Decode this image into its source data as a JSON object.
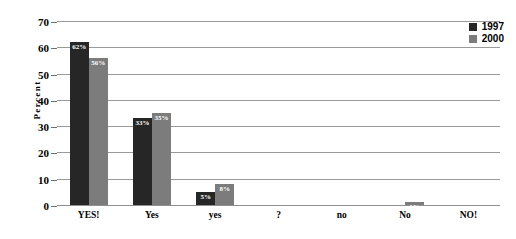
{
  "chart_data": {
    "type": "bar",
    "title": "",
    "subtitle": "",
    "xlabel": "",
    "ylabel": "Percent",
    "categories": [
      "YES!",
      "Yes",
      "yes",
      "?",
      "no",
      "No",
      "NO!"
    ],
    "series": [
      {
        "name": "1997",
        "color": "#262626",
        "values": [
          62,
          33,
          5,
          0,
          0,
          0,
          0
        ],
        "labels": [
          "62%",
          "33%",
          "5%",
          "",
          "",
          "",
          ""
        ]
      },
      {
        "name": "2000",
        "color": "#7c7c7c",
        "values": [
          56,
          35,
          8,
          0,
          0,
          1,
          0
        ],
        "labels": [
          "56%",
          "35%",
          "8%",
          "",
          "",
          "1%",
          ""
        ]
      }
    ],
    "ylim": [
      0,
      70
    ],
    "yticks": [
      0,
      10,
      20,
      30,
      40,
      50,
      60,
      70
    ],
    "ytick_labels": [
      "0",
      "10",
      "20",
      "30",
      "40",
      "50",
      "60",
      "70"
    ],
    "grid": true,
    "grid_axis": "y",
    "legend_position": "top-right",
    "value_labels_inside_bars": true
  },
  "legend": {
    "entries": [
      {
        "label": "1997",
        "swatch": "legend-swatch-1997"
      },
      {
        "label": "2000",
        "swatch": "legend-swatch-2000"
      }
    ]
  },
  "colors": {
    "series_1997": "#262626",
    "series_2000": "#7c7c7c",
    "gridline": "#9a9a9a",
    "axis_text": "#000000",
    "bar_label_text": "#ffffff",
    "background": "#ffffff"
  }
}
